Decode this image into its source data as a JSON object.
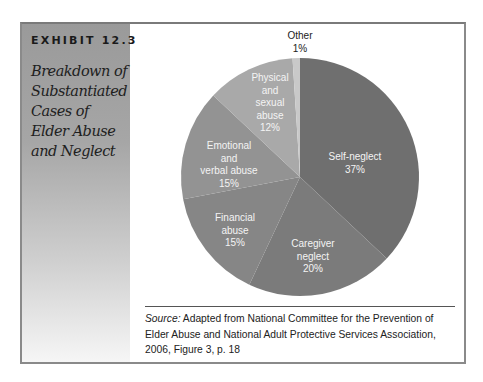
{
  "exhibit": {
    "number": "EXHIBIT 12.3",
    "title": "Breakdown of Substantiated Cases of Elder Abuse and Neglect"
  },
  "chart_data": {
    "type": "pie",
    "title": "Breakdown of Substantiated Cases of Elder Abuse and Neglect",
    "start_angle": "12 o'clock, clockwise",
    "categories": [
      "Self-neglect",
      "Caregiver neglect",
      "Financial abuse",
      "Emotional and verbal abuse",
      "Physical and sexual abuse",
      "Other"
    ],
    "values": [
      37,
      20,
      15,
      15,
      12,
      1
    ],
    "unit": "%",
    "colors": [
      "#6f6f6f",
      "#7b7b7b",
      "#868686",
      "#939393",
      "#a9a9a9",
      "#c9c9c9"
    ],
    "legend": "none (direct labels)"
  },
  "labels": {
    "self_neglect": {
      "name": "Self-neglect",
      "pct": "37%"
    },
    "caregiver": {
      "line1": "Caregiver",
      "line2": "neglect",
      "pct": "20%"
    },
    "financial": {
      "line1": "Financial",
      "line2": "abuse",
      "pct": "15%"
    },
    "emotional": {
      "line1": "Emotional",
      "line2": "and",
      "line3": "verbal abuse",
      "pct": "15%"
    },
    "physical": {
      "line1": "Physical",
      "line2": "and",
      "line3": "sexual",
      "line4": "abuse",
      "pct": "12%"
    },
    "other": {
      "name": "Other",
      "pct": "1%"
    }
  },
  "source": {
    "label": "Source:",
    "text": " Adapted from National Committee for the Prevention of Elder Abuse and National Adult Protective Services Association, 2006, Figure 3, p. 18"
  }
}
